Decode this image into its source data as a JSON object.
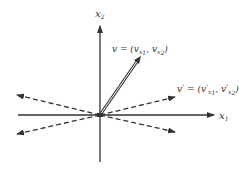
{
  "diagram": {
    "title": "",
    "axes": {
      "x_label": "x",
      "x_sub": "1",
      "y_label": "x",
      "y_sub": "2"
    },
    "vector_v": {
      "label_prefix": "v = (v",
      "sub1": "x",
      "sub1b": "1",
      "comma": ", v",
      "sub2": "x",
      "sub2b": "2",
      "close": ")"
    },
    "vector_v_prime": {
      "label_prefix": "v′ = (v′",
      "sub1": "x",
      "sub1b": "1",
      "comma": ", v′",
      "sub2": "x",
      "sub2b": "2",
      "close": ")"
    },
    "colors": {
      "stroke": "#333333",
      "background": "#ffffff"
    },
    "dashed_vectors_count": 4
  }
}
